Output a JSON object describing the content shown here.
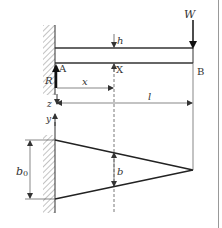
{
  "diagram": {
    "type": "cantilever beam with tapered width",
    "colors": {
      "line": "#333333",
      "thin_line": "#555555",
      "hatch": "#888888",
      "border": "#999999"
    },
    "labels": {
      "load": "W",
      "height": "h",
      "reaction": "R",
      "fixed_end": "A",
      "section": "X",
      "free_end": "B",
      "position": "x",
      "length": "l",
      "z_axis": "z",
      "y_axis": "y",
      "root_width": "b",
      "root_width_sub": "0",
      "section_width": "b"
    }
  }
}
